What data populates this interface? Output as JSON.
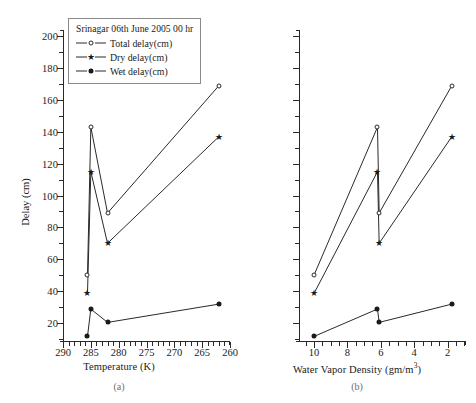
{
  "figure": {
    "panels": [
      {
        "id": "a",
        "caption": "(a)",
        "xlabel": "Temperature (K)",
        "ylabel": "Delay (cm)"
      },
      {
        "id": "b",
        "caption": "(b)",
        "xlabel_html": "Water Vapor Density (gm/m3)",
        "xlabel_main": "Water Vapor Density (gm/m",
        "xlabel_sup": "3",
        "xlabel_tail": ")",
        "ylabel": "Delay (cm)"
      }
    ],
    "legend": {
      "title": "Srinagar 06th June 2005 00 hr",
      "entries": [
        {
          "label": "Total delay(cm)",
          "marker": "open-circle"
        },
        {
          "label": "Dry delay(cm)",
          "marker": "star"
        },
        {
          "label": "Wet delay(cm)",
          "marker": "filled-circle"
        }
      ]
    },
    "colors": {
      "line": "#2a2a2a",
      "marker_fill": "#1a1a1a",
      "marker_open": "#ffffff",
      "axis": "#2a2a2a",
      "background": "#ffffff",
      "caption": "#6e6e6e"
    }
  },
  "chart_data": [
    {
      "type": "line",
      "panel": "a",
      "title": "Srinagar 06th June 2005 00 hr",
      "xlabel": "Temperature (K)",
      "ylabel": "Delay (cm)",
      "xlim": [
        290,
        260
      ],
      "ylim": [
        8,
        204
      ],
      "x_reversed": true,
      "grid": false,
      "legend_position": "top-center",
      "xticks": [
        290,
        285,
        280,
        275,
        270,
        265,
        260
      ],
      "xminor_step": 1,
      "yticks": [
        20,
        40,
        60,
        80,
        100,
        120,
        140,
        160,
        180,
        200
      ],
      "yminor_step": 10,
      "x": [
        285.6,
        285.0,
        282.0,
        262.0
      ],
      "series": [
        {
          "name": "Total delay(cm)",
          "marker": "open-circle",
          "values": [
            50.0,
            143.0,
            89.0,
            169.0
          ]
        },
        {
          "name": "Dry delay(cm)",
          "marker": "star",
          "values": [
            38.5,
            115.0,
            70.0,
            137.0
          ]
        },
        {
          "name": "Wet delay(cm)",
          "marker": "filled-circle",
          "values": [
            11.5,
            28.7,
            20.3,
            31.8
          ]
        }
      ]
    },
    {
      "type": "line",
      "panel": "b",
      "title": "Srinagar 06th June 2005 00 hr",
      "xlabel": "Water Vapor Density (gm/m3)",
      "ylabel": "Delay (cm)",
      "xlim": [
        10.9,
        0.9
      ],
      "ylim": [
        8,
        204
      ],
      "x_reversed": true,
      "grid": false,
      "legend_position": "top-center",
      "xticks": [
        10,
        8,
        6,
        4,
        2
      ],
      "xminor_step": 0.5,
      "yticks": [
        20,
        40,
        60,
        80,
        100,
        120,
        140,
        160,
        180,
        200
      ],
      "yminor_step": 10,
      "x": [
        10.0,
        6.2,
        6.1,
        1.75
      ],
      "series": [
        {
          "name": "Total delay(cm)",
          "marker": "open-circle",
          "values": [
            50.0,
            143.0,
            89.0,
            169.0
          ]
        },
        {
          "name": "Dry delay(cm)",
          "marker": "star",
          "values": [
            38.5,
            115.0,
            70.0,
            137.0
          ]
        },
        {
          "name": "Wet delay(cm)",
          "marker": "filled-circle",
          "values": [
            11.5,
            28.7,
            20.3,
            31.8
          ]
        }
      ]
    }
  ]
}
